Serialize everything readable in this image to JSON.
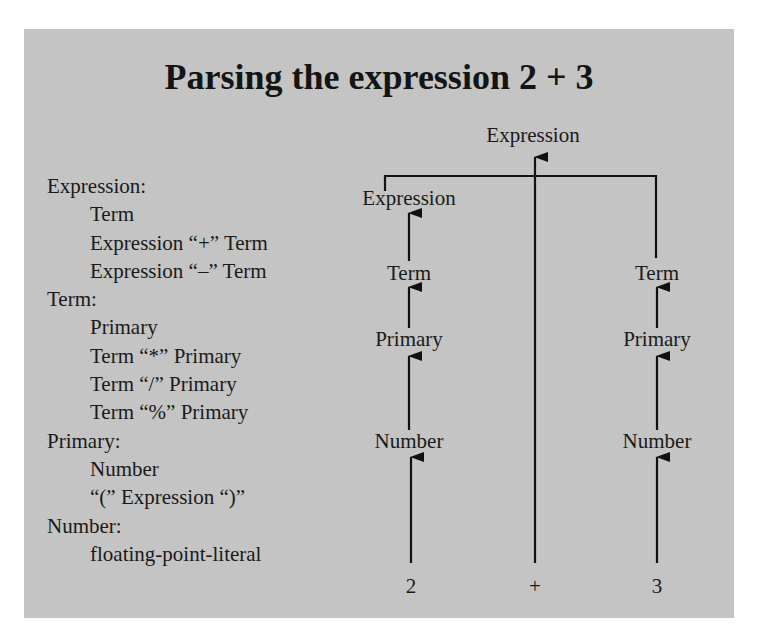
{
  "cutoff_text": "",
  "title": "Parsing the expression 2 + 3",
  "colors": {
    "panel_background": "#c4c4c4",
    "text": "#1a1a1a",
    "line": "#111111"
  },
  "grammar": [
    {
      "type": "rule",
      "text": "Expression:"
    },
    {
      "type": "alt",
      "text": "Term"
    },
    {
      "type": "alt",
      "text": "Expression “+” Term"
    },
    {
      "type": "alt",
      "text": "Expression “–” Term"
    },
    {
      "type": "rule",
      "text": "Term:"
    },
    {
      "type": "alt",
      "text": "Primary"
    },
    {
      "type": "alt",
      "text": "Term “*” Primary"
    },
    {
      "type": "alt",
      "text": "Term “/” Primary"
    },
    {
      "type": "alt",
      "text": "Term “%” Primary"
    },
    {
      "type": "rule",
      "text": "Primary:"
    },
    {
      "type": "alt",
      "text": "Number"
    },
    {
      "type": "alt",
      "text": "“(” Expression “)”"
    },
    {
      "type": "rule",
      "text": "Number:"
    },
    {
      "type": "alt",
      "text": "floating-point-literal"
    }
  ],
  "tree": {
    "root": "Expression",
    "left_branch": [
      "Expression",
      "Term",
      "Primary",
      "Number"
    ],
    "right_branch": [
      "Term",
      "Primary",
      "Number"
    ],
    "tokens": [
      "2",
      "+",
      "3"
    ]
  }
}
